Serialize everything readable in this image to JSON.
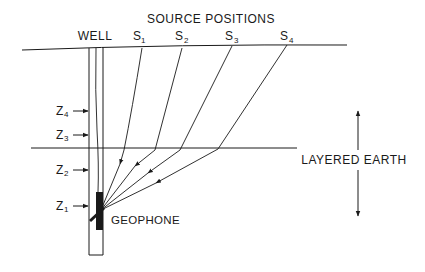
{
  "diagram": {
    "title": "SOURCE POSITIONS",
    "well_label": "WELL",
    "sources": [
      {
        "label": "S",
        "sub": "1"
      },
      {
        "label": "S",
        "sub": "2"
      },
      {
        "label": "S",
        "sub": "3"
      },
      {
        "label": "S",
        "sub": "4"
      }
    ],
    "depths": [
      {
        "label": "Z",
        "sub": "4"
      },
      {
        "label": "Z",
        "sub": "3"
      },
      {
        "label": "Z",
        "sub": "2"
      },
      {
        "label": "Z",
        "sub": "1"
      }
    ],
    "geophone_label": "GEOPHONE",
    "layer_label": "LAYERED EARTH",
    "line_color": "#1a1a1a",
    "background": "#ffffff"
  }
}
